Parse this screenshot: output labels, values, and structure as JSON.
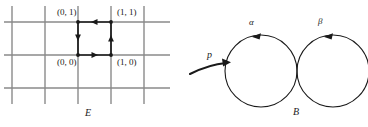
{
  "figure": {
    "left_panel": {
      "name": "covering-space-grid",
      "space_label": "E",
      "vertex_labels": [
        {
          "id": "v01",
          "text": "(0, 1)"
        },
        {
          "id": "v11",
          "text": "(1, 1)"
        },
        {
          "id": "v00",
          "text": "(0, 0)"
        },
        {
          "id": "v10",
          "text": "(1, 0)"
        }
      ],
      "grid": {
        "vertical_lines_x": [
          12,
          45,
          78,
          111,
          144
        ],
        "horizontal_lines_y": [
          22,
          55,
          88
        ],
        "x_extent": [
          4,
          170
        ],
        "y_extent": [
          6,
          104
        ],
        "line_color": "#8a8a8a",
        "line_width": 1.4
      },
      "highlighted_square": {
        "x0": 78,
        "y0": 22,
        "x1": 111,
        "y1": 55,
        "color": "#1a1a1a",
        "line_width": 1.6,
        "edge_arrows": [
          {
            "edge": "top",
            "direction": "left"
          },
          {
            "edge": "right",
            "direction": "up"
          },
          {
            "edge": "bottom",
            "direction": "right"
          },
          {
            "edge": "left",
            "direction": "down"
          }
        ],
        "vertex_dots": 4
      }
    },
    "map_arrow": {
      "name": "covering-map-arrow",
      "label": "p",
      "color": "#1a1a1a"
    },
    "right_panel": {
      "name": "wedge-of-two-circles",
      "space_label": "B",
      "loops": [
        {
          "id": "alpha",
          "label": "α",
          "arrow_direction": "left",
          "cx": 261,
          "cy": 71,
          "r": 36
        },
        {
          "id": "beta",
          "label": "β",
          "arrow_direction": "left",
          "cx": 333,
          "cy": 71,
          "r": 36
        }
      ],
      "circle_color": "#1a1a1a",
      "circle_width": 1.1
    }
  }
}
